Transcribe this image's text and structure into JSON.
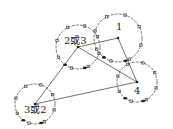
{
  "diagram": {
    "nodes": [
      {
        "id": "n23",
        "label": "2或3",
        "cx": 78,
        "cy": 47,
        "r": 22,
        "lx": 64,
        "ly": 44
      },
      {
        "id": "n1",
        "label": "1",
        "cx": 118,
        "cy": 38,
        "r": 24,
        "lx": 116,
        "ly": 30
      },
      {
        "id": "n4",
        "label": "4",
        "cx": 137,
        "cy": 82,
        "r": 20,
        "lx": 134,
        "ly": 94
      },
      {
        "id": "n32",
        "label": "3或2",
        "cx": 35,
        "cy": 104,
        "r": 20,
        "lx": 24,
        "ly": 113
      }
    ],
    "edges": [
      {
        "from": "n23",
        "to": "n1"
      },
      {
        "from": "n23",
        "to": "n4"
      },
      {
        "from": "n1",
        "to": "n4"
      },
      {
        "from": "n23",
        "to": "n32"
      },
      {
        "from": "n32",
        "to": "n4"
      }
    ],
    "colors": {
      "stroke": "#555555",
      "text": "#222222",
      "background": "#ffffff"
    }
  }
}
